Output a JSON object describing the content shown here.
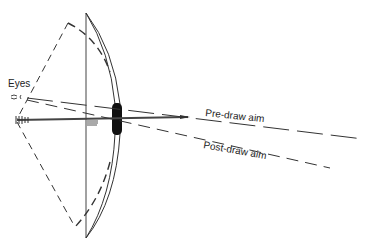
{
  "diagram": {
    "labels": {
      "eyes": "Eyes",
      "pre_draw": "Pre-draw aim",
      "post_draw": "Post-draw aim"
    },
    "colors": {
      "line": "#333333",
      "grip": "#111111",
      "background": "#ffffff"
    }
  }
}
